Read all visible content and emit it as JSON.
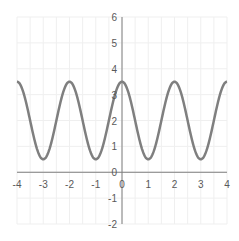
{
  "chart_data": {
    "type": "line",
    "title": "",
    "xlabel": "",
    "ylabel": "",
    "function": "y = 2 + 1.5*cos(pi*x)",
    "xlim": [
      -4,
      4
    ],
    "ylim": [
      -2,
      6
    ],
    "grid": true,
    "legend": null,
    "x_ticks": [
      "-4",
      "-3",
      "-2",
      "-1",
      "0",
      "1",
      "2",
      "3",
      "4"
    ],
    "y_ticks": [
      "-2",
      "-1",
      "0",
      "1",
      "2",
      "3",
      "4",
      "5",
      "6"
    ],
    "series": [
      {
        "name": "curve",
        "color": "#7f7f7f",
        "x": [
          -4,
          -3.5,
          -3,
          -2.5,
          -2,
          -1.5,
          -1,
          -0.5,
          0,
          0.5,
          1,
          1.5,
          2,
          2.5,
          3,
          3.5,
          4
        ],
        "values": [
          3.5,
          2,
          0.5,
          2,
          3.5,
          2,
          0.5,
          2,
          3.5,
          2,
          0.5,
          2,
          3.5,
          2,
          0.5,
          2,
          3.5
        ]
      }
    ]
  },
  "colors": {
    "axis": "#7f7f7f",
    "grid": "#efefef",
    "curve": "#7f7f7f",
    "tick_label": "#595959"
  }
}
